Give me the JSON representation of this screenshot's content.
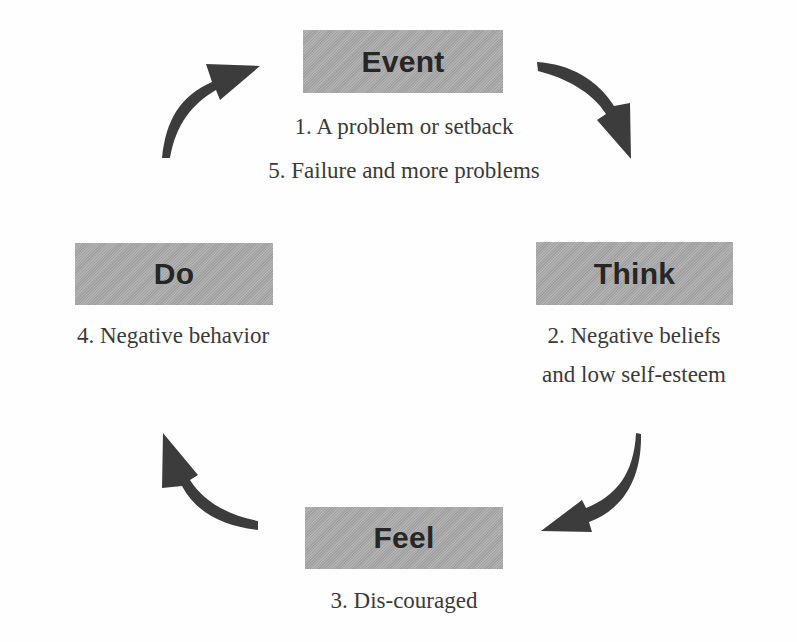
{
  "diagram": {
    "type": "cycle",
    "colors": {
      "box_fill": "#a9a9a9",
      "box_text": "#262626",
      "arrow": "#3c3c3c",
      "caption_text": "#3a3a3a",
      "background": "#fefefe"
    },
    "nodes": [
      {
        "id": "event",
        "label": "Event",
        "captions": [
          "1. A problem or setback",
          "5. Failure and more problems"
        ]
      },
      {
        "id": "think",
        "label": "Think",
        "captions": [
          "2. Negative beliefs",
          "and low self-esteem"
        ]
      },
      {
        "id": "feel",
        "label": "Feel",
        "captions": [
          "3. Dis-couraged"
        ]
      },
      {
        "id": "do",
        "label": "Do",
        "captions": [
          "4. Negative behavior"
        ]
      }
    ],
    "edges": [
      {
        "from": "event",
        "to": "think",
        "icon": "curved-arrow-icon"
      },
      {
        "from": "think",
        "to": "feel",
        "icon": "curved-arrow-icon"
      },
      {
        "from": "feel",
        "to": "do",
        "icon": "curved-arrow-icon"
      },
      {
        "from": "do",
        "to": "event",
        "icon": "curved-arrow-icon"
      }
    ]
  }
}
